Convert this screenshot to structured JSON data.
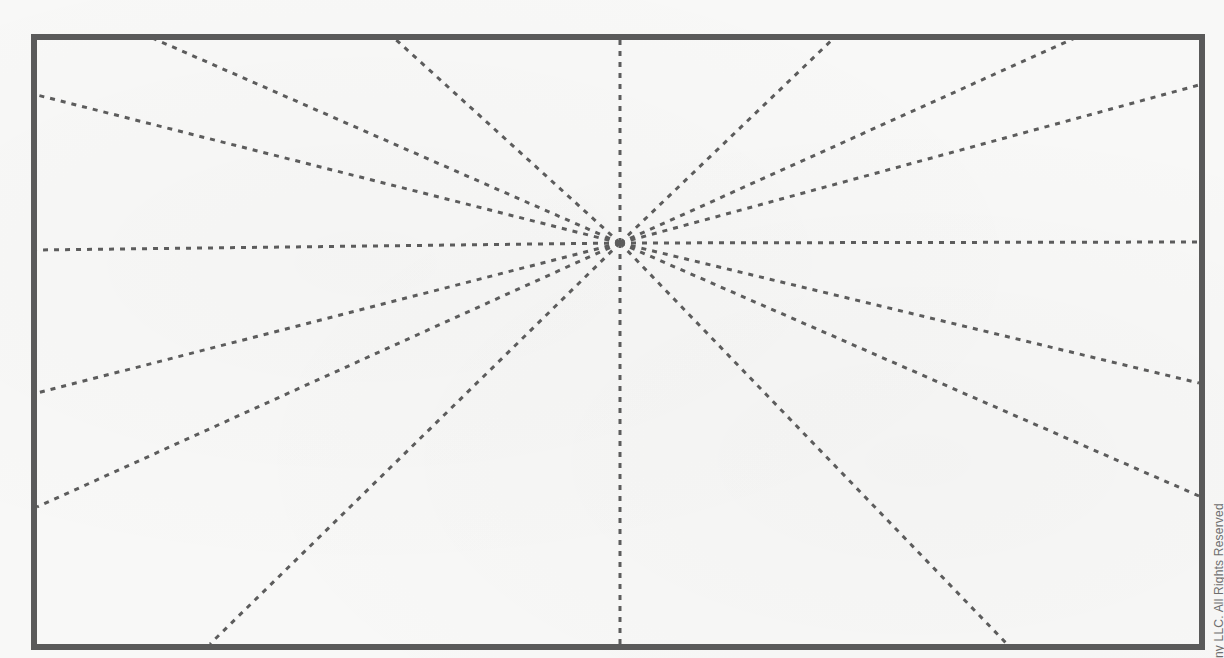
{
  "diagram": {
    "frame": {
      "x1": 34,
      "y1": 37,
      "x2": 1202,
      "y2": 647,
      "stroke": "#5a5a5a",
      "stroke_width": 6
    },
    "vanishing_point": {
      "x": 620,
      "y": 243
    },
    "guide_line_color": "#5c5c5c",
    "guide_line_dash": "5 6",
    "guide_line_endpoints": [
      {
        "edge": "top",
        "x": 150,
        "y": 37
      },
      {
        "edge": "top",
        "x": 393,
        "y": 37
      },
      {
        "edge": "top",
        "x": 620,
        "y": 37
      },
      {
        "edge": "top",
        "x": 835,
        "y": 37
      },
      {
        "edge": "top",
        "x": 1077,
        "y": 37
      },
      {
        "edge": "right",
        "x": 1199,
        "y": 85
      },
      {
        "edge": "right",
        "x": 1199,
        "y": 242
      },
      {
        "edge": "right",
        "x": 1199,
        "y": 383
      },
      {
        "edge": "right",
        "x": 1199,
        "y": 496
      },
      {
        "edge": "bottom",
        "x": 1007,
        "y": 644
      },
      {
        "edge": "bottom",
        "x": 620,
        "y": 644
      },
      {
        "edge": "bottom",
        "x": 210,
        "y": 644
      },
      {
        "edge": "left",
        "x": 37,
        "y": 507
      },
      {
        "edge": "left",
        "x": 37,
        "y": 393
      },
      {
        "edge": "left",
        "x": 37,
        "y": 250
      },
      {
        "edge": "left",
        "x": 37,
        "y": 95
      }
    ]
  },
  "copyright_text": "ny LLC. All Rights Reserved"
}
